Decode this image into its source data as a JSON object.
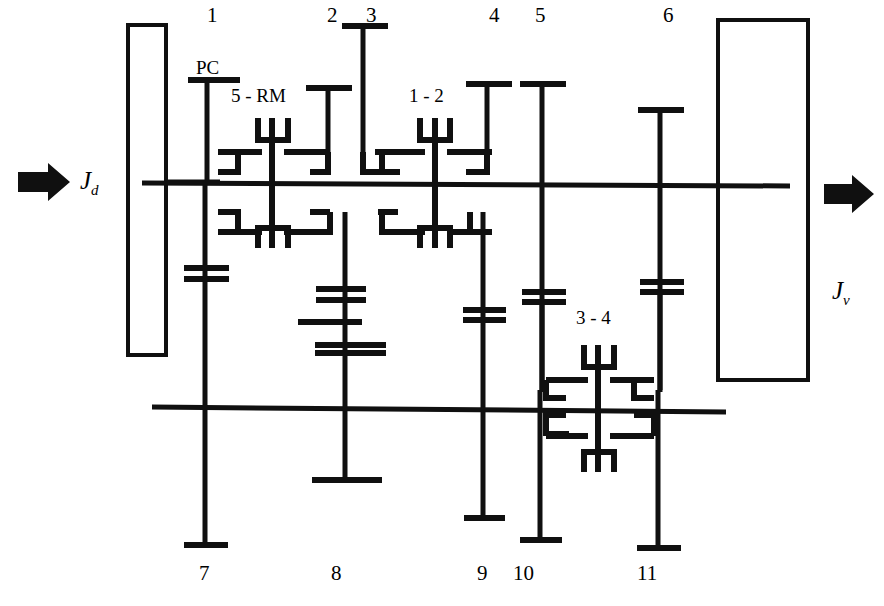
{
  "diagram": {
    "stroke_color": "#101010",
    "background_color": "#ffffff",
    "input_label": "J",
    "input_subscript": "d",
    "output_label": "J",
    "output_subscript": "v",
    "input_arrow_icon": "right-arrow-icon",
    "output_arrow_icon": "right-arrow-icon"
  },
  "top_labels": [
    {
      "text": "1",
      "x": 207,
      "y": 5
    },
    {
      "text": "2",
      "x": 327,
      "y": 5
    },
    {
      "text": "3",
      "x": 366,
      "y": 5
    },
    {
      "text": "4",
      "x": 489,
      "y": 5
    },
    {
      "text": "5",
      "x": 535,
      "y": 5
    },
    {
      "text": "6",
      "x": 663,
      "y": 5
    }
  ],
  "bottom_labels": [
    {
      "text": "7",
      "x": 199,
      "y": 563
    },
    {
      "text": "8",
      "x": 331,
      "y": 563
    },
    {
      "text": "9",
      "x": 477,
      "y": 563
    },
    {
      "text": "10",
      "x": 515,
      "y": 563
    },
    {
      "text": "11",
      "x": 639,
      "y": 563
    }
  ],
  "annotations": [
    {
      "text": "PC",
      "x": 196,
      "y": 60
    },
    {
      "text": "5 - RM",
      "x": 231,
      "y": 87
    },
    {
      "text": "1 - 2",
      "x": 409,
      "y": 87
    },
    {
      "text": "3 - 4",
      "x": 576,
      "y": 310
    }
  ],
  "shafts": {
    "upper_main": {
      "y": 182,
      "x1": 142,
      "x2": 790
    },
    "lower_counter": {
      "y": 408,
      "x1": 152,
      "x2": 726
    }
  },
  "housings": [
    {
      "name": "input-housing",
      "x": 128,
      "y": 25,
      "w": 38,
      "h": 330
    },
    {
      "name": "output-housing",
      "x": 718,
      "y": 20,
      "w": 90,
      "h": 360
    }
  ],
  "synchronizers": [
    {
      "name": "5-RM",
      "x": 272,
      "top": true
    },
    {
      "name": "1-2",
      "x": 435,
      "top": true
    },
    {
      "name": "3-4",
      "x": 598,
      "top": false
    }
  ]
}
